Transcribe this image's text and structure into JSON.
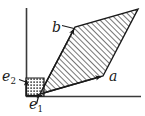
{
  "figure": {
    "type": "vector-diagram",
    "colors": {
      "stroke": "#1a1a1a",
      "axis": "#3a3a3a",
      "hatch": "#555555",
      "fill_background": "#ffffff",
      "unit_square_dots": "#2a2a2a"
    },
    "axes": {
      "x_axis": {
        "name": "horizontal-axis",
        "x1": 26,
        "y1": 96,
        "x2": 141,
        "y2": 96
      },
      "y_axis": {
        "name": "vertical-axis",
        "x1": 26,
        "y1": 8,
        "x2": 26,
        "y2": 96
      }
    },
    "labels": [
      {
        "id": "e2",
        "base": "e",
        "sub": "2",
        "x": 2,
        "y": 69
      },
      {
        "id": "e1",
        "base": "e",
        "sub": "1",
        "x": 29,
        "y": 97
      },
      {
        "id": "b",
        "base": "b",
        "sub": "",
        "x": 52,
        "y": 20
      },
      {
        "id": "a",
        "base": "a",
        "sub": "",
        "x": 109,
        "y": 69
      }
    ],
    "unit_square": {
      "name": "unit-square",
      "points": "26,96 26,78 44,78 44,96",
      "pattern": "stipple-dots"
    },
    "parallelogram": {
      "name": "parallelogram-spanned-by-a-and-b",
      "points": "40,94 103,76 138,9 75,27",
      "pattern": "diagonal-hatch"
    },
    "vectors": [
      {
        "id": "vec-e1",
        "name": "vector-e1",
        "x1": 26,
        "y1": 96,
        "x2": 44,
        "y2": 96
      },
      {
        "id": "vec-e2",
        "name": "vector-e2",
        "x1": 26,
        "y1": 96,
        "x2": 26,
        "y2": 78
      },
      {
        "id": "vec-a",
        "name": "vector-a",
        "x1": 40,
        "y1": 94,
        "x2": 103,
        "y2": 76
      },
      {
        "id": "vec-b",
        "name": "vector-b",
        "x1": 40,
        "y1": 94,
        "x2": 75,
        "y2": 27
      }
    ],
    "leader_lines": [
      {
        "id": "leader-e1",
        "name": "leader-line-e1",
        "x1": 38,
        "y1": 97,
        "x2": 36,
        "y2": 104
      },
      {
        "id": "leader-e2",
        "name": "leader-line-e2",
        "x1": 25,
        "y1": 83,
        "x2": 18,
        "y2": 80
      },
      {
        "id": "leader-b",
        "name": "leader-line-b",
        "x1": 73,
        "y1": 28,
        "x2": 61,
        "y2": 25
      }
    ]
  }
}
